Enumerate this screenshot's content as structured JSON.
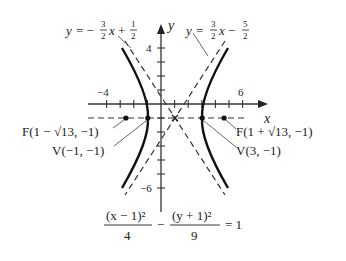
{
  "figure": {
    "type": "hyperbola",
    "equation": {
      "term1_numerator": "(x − 1)²",
      "term1_denominator": "4",
      "minus": "−",
      "term2_numerator": "(y + 1)²",
      "term2_denominator": "9",
      "equals": "= 1"
    },
    "axes": {
      "x_label": "x",
      "y_label": "y",
      "x_tick_labels": [
        {
          "value": -4,
          "text": "−4"
        },
        {
          "value": 6,
          "text": "6"
        }
      ],
      "y_tick_labels": [
        {
          "value": 4,
          "text": "4"
        },
        {
          "value": -6,
          "text": "−6"
        }
      ],
      "x_range": [
        -5,
        7
      ],
      "y_range": [
        -7,
        5
      ]
    },
    "center": {
      "x": 1,
      "y": -1
    },
    "vertices": [
      {
        "label": "V(−1, −1)",
        "x": -1,
        "y": -1
      },
      {
        "label": "V(3, −1)",
        "x": 3,
        "y": -1
      }
    ],
    "foci": [
      {
        "label": "F(1 − √13, −1)",
        "x": -2.606,
        "y": -1
      },
      {
        "label": "F(1 + √13, −1)",
        "x": 4.606,
        "y": -1
      }
    ],
    "asymptotes": [
      {
        "label_lhs": "y = −",
        "frac_num": "3",
        "frac_den": "2",
        "mid": "x +",
        "const_num": "1",
        "const_den": "2",
        "slope": -1.5,
        "intercept": 0.5
      },
      {
        "label_lhs": "y =",
        "frac_num": "3",
        "frac_den": "2",
        "mid": "x −",
        "const_num": "5",
        "const_den": "2",
        "slope": 1.5,
        "intercept": -2.5
      }
    ]
  },
  "colors": {
    "ink": "#222222",
    "curve": "#111111",
    "asymptote": "#333333",
    "leader": "#555555"
  }
}
